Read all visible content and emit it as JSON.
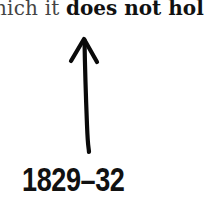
{
  "text_fragment": {
    "light": "hich it",
    "bold": "does not hol"
  },
  "arrow": {
    "direction": "up",
    "icon": "hand-drawn-arrow-up-icon"
  },
  "label": {
    "year": "1829–32"
  }
}
